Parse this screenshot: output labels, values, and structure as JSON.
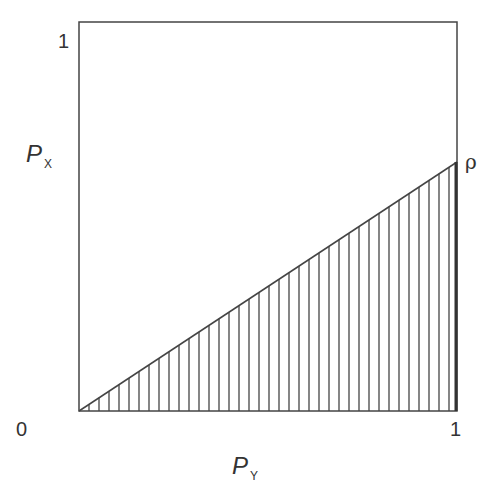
{
  "diagram": {
    "x_axis": {
      "label_main": "P",
      "label_sub": "Y",
      "tick_min": "0",
      "tick_max": "1"
    },
    "y_axis": {
      "label_main": "P",
      "label_sub": "X",
      "tick_max": "1"
    },
    "line_end_label": "ρ",
    "line_end_value_fraction": 0.64,
    "shaded_region": "triangle below line from origin to (1, ρ), vertical hatching",
    "colors": {
      "stroke": "#444444",
      "background": "#ffffff"
    }
  }
}
